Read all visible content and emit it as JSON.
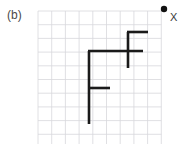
{
  "figure": {
    "panel_label": "(b)",
    "point_label": "X",
    "background_color": "#ffffff",
    "grid": {
      "line_color": "#d8d8dc",
      "line_width": 0.8,
      "origin_x": 38,
      "origin_y": 11,
      "cell_size": 13.7,
      "columns": 9,
      "rows": 10
    },
    "path": {
      "stroke_color": "#1a1a1a",
      "stroke_width": 2.6,
      "segments": [
        {
          "name": "top-horizontal",
          "x1": 127,
          "y1": 32,
          "x2": 148,
          "y2": 32
        },
        {
          "name": "upper-vertical",
          "x1": 128,
          "y1": 32,
          "x2": 128,
          "y2": 68
        },
        {
          "name": "middle-horizontal",
          "x1": 88,
          "y1": 51,
          "x2": 143,
          "y2": 51
        },
        {
          "name": "left-vertical",
          "x1": 89,
          "y1": 51,
          "x2": 89,
          "y2": 124
        },
        {
          "name": "lower-horizontal",
          "x1": 89,
          "y1": 88,
          "x2": 110,
          "y2": 88
        }
      ]
    },
    "marker": {
      "name": "point-x-dot",
      "cx": 164,
      "cy": 9,
      "r": 3.2,
      "fill": "#111111"
    }
  }
}
